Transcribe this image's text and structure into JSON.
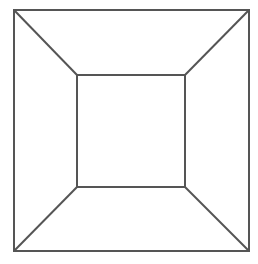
{
  "diagram": {
    "title": "",
    "stroke_color": "#555555",
    "stroke_width": 2,
    "background": "#ffffff",
    "outer_square": {
      "x1": 14,
      "y1": 10,
      "x2": 249,
      "y2": 251
    },
    "inner_square": {
      "x1": 77,
      "y1": 75,
      "x2": 185,
      "y2": 187
    },
    "connectors": [
      {
        "from": [
          14,
          10
        ],
        "to": [
          77,
          75
        ]
      },
      {
        "from": [
          249,
          10
        ],
        "to": [
          185,
          75
        ]
      },
      {
        "from": [
          14,
          251
        ],
        "to": [
          77,
          187
        ]
      },
      {
        "from": [
          249,
          251
        ],
        "to": [
          185,
          187
        ]
      }
    ]
  }
}
